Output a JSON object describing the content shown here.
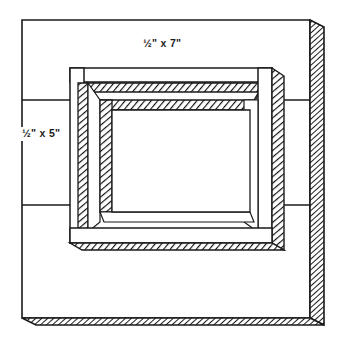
{
  "drawing": {
    "title": "Board with rectangular frame opening",
    "type": "isometric-line-drawing",
    "background_color": "#ffffff",
    "line_color": "#1a1a1a",
    "hatch_color": "#111111",
    "fill_color": "#ffffff"
  },
  "labels": {
    "top": {
      "text": "½\" x 7\"",
      "name": "dimension-label-top"
    },
    "left": {
      "text": "½\" x 5\"",
      "name": "dimension-label-left"
    }
  },
  "geometry": {
    "outer_board": {
      "left": 22,
      "top": 20,
      "right": 310,
      "bottom": 318,
      "edge_depth": 14
    },
    "inner_frame": {
      "left": 70,
      "top": 68,
      "right": 272,
      "bottom": 243
    },
    "division_lines": [
      {
        "y": 100,
        "name": "board-seam-upper"
      },
      {
        "y": 205,
        "name": "board-seam-lower"
      }
    ]
  }
}
